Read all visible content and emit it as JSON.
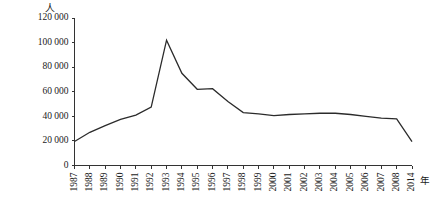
{
  "chart_data": {
    "type": "line",
    "title": "",
    "xlabel": "年",
    "ylabel": "人",
    "ylim": [
      0,
      120000
    ],
    "grid": false,
    "legend": null,
    "y_ticks": [
      "0",
      "20 000",
      "40 000",
      "60 000",
      "80 000",
      "100 000",
      "120 000"
    ],
    "y_tick_values": [
      0,
      20000,
      40000,
      60000,
      80000,
      100000,
      120000
    ],
    "categories": [
      "1987",
      "1988",
      "1989",
      "1990",
      "1991",
      "1992",
      "1993",
      "1994",
      "1995",
      "1996",
      "1997",
      "1998",
      "1999",
      "2000",
      "2001",
      "2002",
      "2003",
      "2004",
      "2005",
      "2006",
      "2007",
      "2008",
      "2014"
    ],
    "values": [
      19500,
      27000,
      32500,
      37500,
      41000,
      47500,
      102000,
      75000,
      62000,
      62500,
      52000,
      43000,
      42000,
      40500,
      41500,
      42000,
      42500,
      42500,
      41500,
      40000,
      38500,
      38000,
      19500
    ]
  },
  "axis": {
    "unit_top": "人",
    "unit_right": "年"
  }
}
